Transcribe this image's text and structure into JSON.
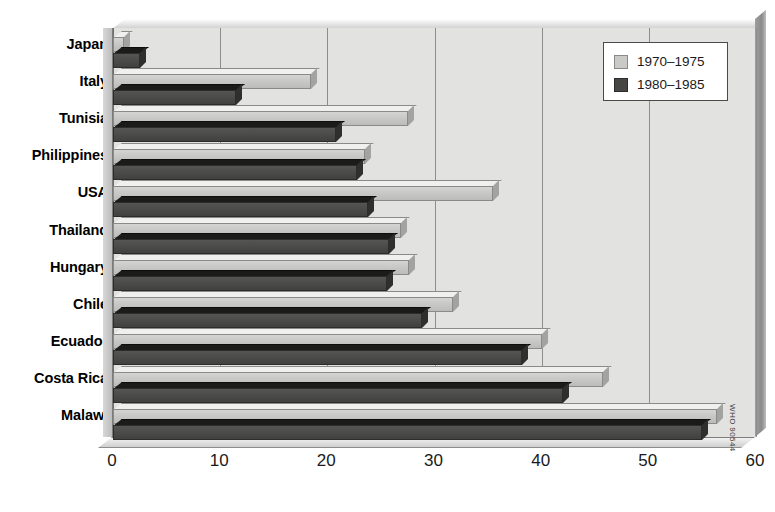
{
  "chart_data": {
    "type": "bar",
    "orientation": "horizontal",
    "title": "",
    "subtitle": "",
    "xlabel": "",
    "ylabel": "",
    "xlim": [
      0,
      60
    ],
    "xticks": [
      0,
      10,
      20,
      30,
      40,
      50,
      60
    ],
    "xtick_labels": [
      "0",
      "10",
      "20",
      "30",
      "40",
      "50",
      "60"
    ],
    "grid": true,
    "grid_axis": "x",
    "legend_position": "top-right",
    "categories": [
      "Japan",
      "Italy",
      "Tunisia",
      "Philippines",
      "USA",
      "Thailand",
      "Hungary",
      "Chile",
      "Ecuador",
      "Costa Rica",
      "Malawi"
    ],
    "series": [
      {
        "name": "1970–1975",
        "color": "#c9c9c7",
        "values": [
          1.0,
          18.5,
          27.5,
          23.5,
          35.5,
          26.9,
          27.6,
          31.7,
          40.0,
          45.7,
          56.4
        ]
      },
      {
        "name": "1980–1985",
        "color": "#464645",
        "values": [
          2.5,
          11.5,
          20.8,
          22.8,
          23.8,
          25.8,
          25.6,
          28.8,
          38.2,
          42.0,
          55.0
        ]
      }
    ],
    "annotations": [
      "WHO 90544"
    ]
  },
  "legend": {
    "items": [
      {
        "label": "1970–1975"
      },
      {
        "label": "1980–1985"
      }
    ]
  },
  "credit": {
    "text": "WHO 90544"
  },
  "colors": {
    "series_a": "#c9c9c7",
    "series_b": "#464645",
    "plot_background": "#e2e2e1",
    "gridline": "#8d8d8d",
    "text": "#000000"
  }
}
